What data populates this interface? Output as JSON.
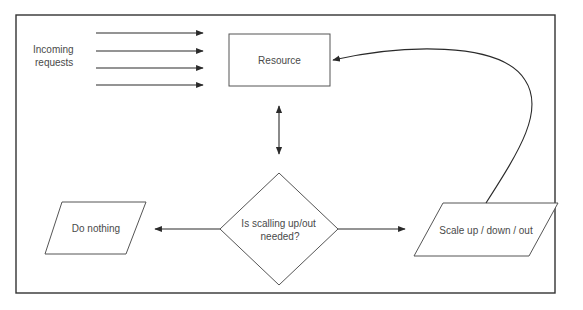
{
  "diagram": {
    "type": "flowchart",
    "title": "",
    "nodes": {
      "incoming": {
        "label_lines": [
          "Incoming",
          "requests"
        ],
        "shape": "text"
      },
      "resource": {
        "label": "Resource",
        "shape": "rectangle"
      },
      "decision": {
        "label_lines": [
          "Is scalling up/out",
          "needed?"
        ],
        "shape": "diamond"
      },
      "do_nothing": {
        "label": "Do nothing",
        "shape": "parallelogram"
      },
      "scale": {
        "label": "Scale up / down / out",
        "shape": "parallelogram"
      }
    },
    "edges": [
      {
        "from": "incoming",
        "to": "resource",
        "count": 4,
        "direction": "forward"
      },
      {
        "from": "resource",
        "to": "decision",
        "direction": "both"
      },
      {
        "from": "decision",
        "to": "do_nothing",
        "direction": "forward"
      },
      {
        "from": "decision",
        "to": "scale",
        "direction": "forward"
      },
      {
        "from": "scale",
        "to": "resource",
        "direction": "forward",
        "style": "curved"
      }
    ],
    "colors": {
      "text": "#4a4a4a",
      "stroke": "#2a2a2a",
      "background": "#ffffff"
    }
  }
}
